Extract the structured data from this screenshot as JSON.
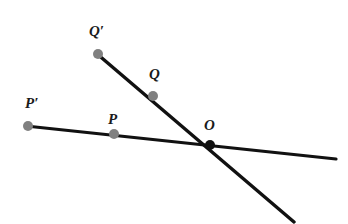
{
  "figure": {
    "background_color": "#ffffff",
    "line_color": "#111111",
    "point_color": "#808080",
    "intersection_color": "#111111",
    "line_width": 3,
    "width": 348,
    "height": 224
  },
  "labels": {
    "q_prime": "Q′",
    "q": "Q",
    "p_prime": "P′",
    "p": "P",
    "o": "O"
  },
  "points": [
    {
      "name": "P-prime",
      "label": "P′",
      "x": 28,
      "y": 126,
      "color": "#808080",
      "radius": 5
    },
    {
      "name": "P",
      "label": "P",
      "x": 114,
      "y": 134,
      "color": "#808080",
      "radius": 5
    },
    {
      "name": "Q-prime",
      "label": "Q′",
      "x": 98,
      "y": 54,
      "color": "#808080",
      "radius": 5
    },
    {
      "name": "Q",
      "label": "Q",
      "x": 153,
      "y": 96,
      "color": "#808080",
      "radius": 5
    },
    {
      "name": "O",
      "label": "O",
      "x": 210,
      "y": 145,
      "color": "#111111",
      "radius": 5
    }
  ],
  "lines": [
    {
      "name": "line-through-P",
      "from": {
        "x": 26,
        "y": 126
      },
      "to": {
        "x": 336,
        "y": 159
      },
      "passes_through": [
        "P′",
        "P",
        "O"
      ]
    },
    {
      "name": "line-through-Q",
      "from": {
        "x": 96,
        "y": 53
      },
      "to": {
        "x": 294,
        "y": 222
      },
      "passes_through": [
        "Q′",
        "Q",
        "O"
      ]
    }
  ]
}
